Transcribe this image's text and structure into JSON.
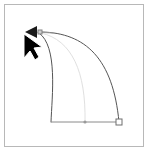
{
  "app": {
    "title": "Vector Curve Editor Canvas",
    "background_color": "#ffffff"
  },
  "canvas": {
    "name": "drawing-canvas",
    "width": 148,
    "height": 153,
    "background_color": "#ffffff",
    "frame": {
      "name": "canvas-border",
      "x": 4.5,
      "y": 4.5,
      "width": 139,
      "height": 142,
      "stroke_color": "#b8b8b8",
      "stroke_width": 1
    }
  },
  "shapes": {
    "outer_curve": {
      "name": "outer-bezier-curve",
      "path": "M 42 32 C 85 33 113 58 119 122",
      "stroke_color": "#555555",
      "stroke_width": 1,
      "fill": "none"
    },
    "inner_curve": {
      "name": "inner-bezier-curve",
      "path": "M 39 33 C 58 46 52 96 51 122",
      "stroke_color": "#555555",
      "stroke_width": 1,
      "fill": "none"
    },
    "ghost_curve": {
      "name": "ghost-preview-curve",
      "path": "M 41 33 C 72 40 86 72 85 122",
      "stroke_color": "#e0e0e0",
      "stroke_width": 1,
      "fill": "none"
    },
    "baseline": {
      "name": "baseline-segment",
      "x1": 51,
      "y1": 122,
      "x2": 119,
      "y2": 122,
      "stroke_color": "#8a8a8a",
      "stroke_width": 1
    }
  },
  "handles": {
    "tangent_line": {
      "name": "tangent-handle-line",
      "x1": 33,
      "y1": 32,
      "x2": 54,
      "y2": 33,
      "stroke_color": "#9a9a9a",
      "stroke_width": 1
    },
    "tangent_arrow": {
      "name": "tangent-direction-arrow",
      "points": "25,32 37,26 37,38",
      "fill_color": "#1a1a1a"
    },
    "tangent_knob": {
      "name": "tangent-handle-knob",
      "x": 38,
      "y": 30,
      "size": 4,
      "fill_color": "#cfcfcf",
      "stroke_color": "#808080"
    },
    "end_node": {
      "name": "end-anchor-point",
      "x": 119,
      "y": 122,
      "radius": 3,
      "fill_color": "#ffffff",
      "stroke_color": "#6e6e6e"
    },
    "mid_node": {
      "name": "midpoint-marker",
      "x": 85,
      "y": 122,
      "radius": 1.6,
      "fill_color": "#9a9a9a"
    }
  },
  "cursor": {
    "name": "mouse-pointer",
    "x": 24,
    "y": 34,
    "fill_color": "#000000",
    "outline_color": "#ffffff",
    "points": "24,34 24,58 30,51 35,60 39,57 34,48 42,47"
  }
}
